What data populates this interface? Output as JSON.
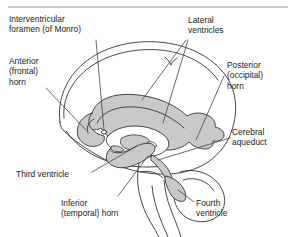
{
  "figure": {
    "top_rule": true,
    "colors": {
      "ink": "#1a1a1a",
      "outline": "#333333",
      "ventricle_fill": "#c9c9c9",
      "ventricle_fill_dark": "#b4b4b4",
      "background": "#ffffff",
      "rule": "#999999"
    }
  },
  "labels": {
    "interventricular_foramen": "Interventricular\nforamen (of Monro)",
    "anterior_horn": "Anterior\n(frontal)\nhorn",
    "lateral_ventricles": "Lateral\nventricles",
    "posterior_horn": "Posterior\n(occipital)\nhorn",
    "cerebral_aqueduct": "Cerebral\naqueduct",
    "third_ventricle": "Third ventricle",
    "inferior_horn": "Inferior\n(temporal) horn",
    "fourth_ventricle": "Fourth\nventricle"
  },
  "icons": {
    "brain_outline": "brain-outline-icon",
    "ventricle_system": "ventricle-system-icon",
    "cerebellum": "cerebellum-icon",
    "brainstem": "brainstem-icon"
  }
}
